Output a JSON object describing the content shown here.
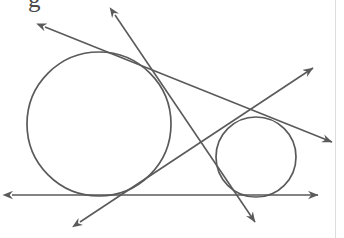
{
  "canvas": {
    "width": 344,
    "height": 238,
    "background": "#ffffff",
    "stroke_color": "#5a5a5a",
    "stroke_width": 1.6,
    "border_color": "#dddddd"
  },
  "figure": {
    "kind": "plane-geometry-diagram",
    "partial_text_top": "g"
  },
  "circles": [
    {
      "name": "large-circle",
      "cx": 99,
      "cy": 124,
      "r": 72
    },
    {
      "name": "small-circle",
      "cx": 256,
      "cy": 157,
      "r": 40
    }
  ],
  "lines": [
    {
      "name": "horizontal-tangent-line",
      "x1": 12,
      "y1": 195,
      "x2": 318,
      "y2": 195,
      "arrows": "both"
    },
    {
      "name": "upper-left-to-right-tangent-line",
      "x1": 45,
      "y1": 27,
      "x2": 332,
      "y2": 142,
      "arrows": "both"
    },
    {
      "name": "steep-top-to-bottom-tangent-line",
      "x1": 115,
      "y1": 15,
      "x2": 255,
      "y2": 222,
      "arrows": "both"
    },
    {
      "name": "bottom-left-to-upper-right-tangent-line",
      "x1": 80,
      "y1": 222,
      "x2": 313,
      "y2": 68,
      "arrows": "both"
    }
  ]
}
